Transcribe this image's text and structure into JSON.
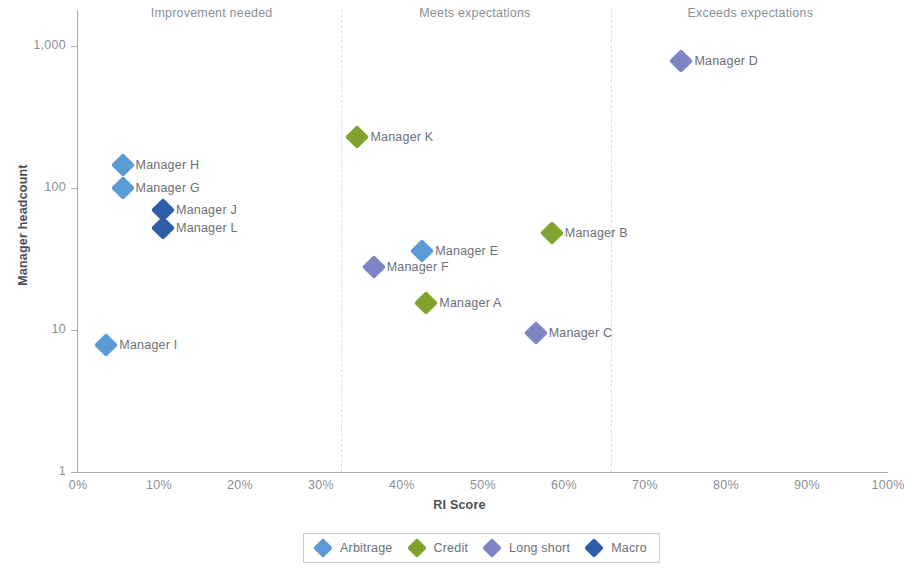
{
  "chart_data": {
    "type": "scatter",
    "title": "",
    "xlabel": "RI Score",
    "ylabel": "Manager headcount",
    "xlim": [
      0,
      100
    ],
    "ylim": [
      1,
      1000
    ],
    "yscale": "log",
    "grid": false,
    "legend_position": "bottom",
    "x_tick_labels": [
      "0%",
      "10%",
      "20%",
      "30%",
      "40%",
      "50%",
      "60%",
      "70%",
      "80%",
      "90%",
      "100%"
    ],
    "x_tick_values": [
      0,
      10,
      20,
      30,
      40,
      50,
      60,
      70,
      80,
      90,
      100
    ],
    "y_tick_labels": [
      "1",
      "10",
      "100",
      "1,000"
    ],
    "y_tick_values": [
      1,
      10,
      100,
      1000
    ],
    "zones": [
      {
        "label": "Improvement needed",
        "x_center": 16.5,
        "x_start": 0,
        "x_end": 32.5
      },
      {
        "label": "Meets expectations",
        "x_center": 49,
        "x_start": 32.5,
        "x_end": 65.8
      },
      {
        "label": "Exceeds expectations",
        "x_center": 83,
        "x_start": 65.8,
        "x_end": 100
      }
    ],
    "zone_dividers": [
      32.5,
      65.8
    ],
    "series": [
      {
        "name": "Arbitrage",
        "color": "#5b9bd5"
      },
      {
        "name": "Credit",
        "color": "#7fa32e"
      },
      {
        "name": "Long short",
        "color": "#8184c4"
      },
      {
        "name": "Macro",
        "color": "#2e5ea8"
      }
    ],
    "points": [
      {
        "label": "Manager D",
        "series": "Long short",
        "x": 74.5,
        "y": 790,
        "label_side": "right"
      },
      {
        "label": "Manager K",
        "series": "Credit",
        "x": 34.5,
        "y": 230,
        "label_side": "right"
      },
      {
        "label": "Manager H",
        "series": "Arbitrage",
        "x": 5.5,
        "y": 145,
        "label_side": "right"
      },
      {
        "label": "Manager G",
        "series": "Arbitrage",
        "x": 5.5,
        "y": 100,
        "label_side": "right"
      },
      {
        "label": "Manager J",
        "series": "Macro",
        "x": 10.5,
        "y": 70,
        "label_side": "right"
      },
      {
        "label": "Manager L",
        "series": "Macro",
        "x": 10.5,
        "y": 52,
        "label_side": "right"
      },
      {
        "label": "Manager B",
        "series": "Credit",
        "x": 58.5,
        "y": 48,
        "label_side": "right"
      },
      {
        "label": "Manager E",
        "series": "Arbitrage",
        "x": 42.5,
        "y": 36,
        "label_side": "right"
      },
      {
        "label": "Manager F",
        "series": "Long short",
        "x": 36.5,
        "y": 28,
        "label_side": "right"
      },
      {
        "label": "Manager A",
        "series": "Credit",
        "x": 43.0,
        "y": 15.5,
        "label_side": "right"
      },
      {
        "label": "Manager C",
        "series": "Long short",
        "x": 56.5,
        "y": 9.5,
        "label_side": "right"
      },
      {
        "label": "Manager I",
        "series": "Arbitrage",
        "x": 3.5,
        "y": 7.8,
        "label_side": "right"
      }
    ],
    "legend_entries": [
      {
        "label": "Arbitrage",
        "color": "#5b9bd5"
      },
      {
        "label": "Credit",
        "color": "#7fa32e"
      },
      {
        "label": "Long short",
        "color": "#8184c4"
      },
      {
        "label": "Macro",
        "color": "#2e5ea8"
      }
    ]
  }
}
